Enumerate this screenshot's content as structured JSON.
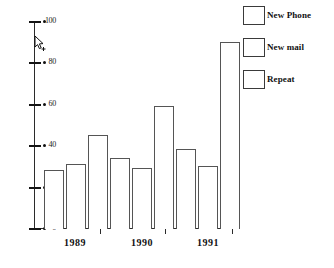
{
  "chart_data": {
    "type": "bar",
    "title": "",
    "xlabel": "",
    "ylabel": "",
    "categories": [
      "1989",
      "1990",
      "1991"
    ],
    "series": [
      {
        "name": "New Phone",
        "values": [
          28,
          34,
          38
        ]
      },
      {
        "name": "New mail",
        "values": [
          31,
          29,
          30
        ]
      },
      {
        "name": "Repeat",
        "values": [
          45,
          59,
          90
        ]
      }
    ],
    "ylim": [
      0,
      100
    ],
    "yticks": [
      0,
      20,
      40,
      60,
      80,
      100
    ],
    "ytick_labels": [
      "0",
      "20",
      "40",
      "60",
      "80",
      "100"
    ],
    "grid": false,
    "legend_position": "right",
    "bar_fill": "#ffffff",
    "bar_outline": "#555555",
    "axis_color": "#2b2b2b"
  },
  "legend": {
    "items": [
      {
        "label": "New Phone"
      },
      {
        "label": "New mail"
      },
      {
        "label": "Repeat"
      }
    ]
  },
  "axis": {
    "y_labels": [
      "100",
      "80",
      "60",
      "40",
      "20",
      "0"
    ],
    "x_labels": [
      "1989",
      "1990",
      "1991"
    ]
  },
  "cursor": {
    "name": "mouse-pointer"
  }
}
